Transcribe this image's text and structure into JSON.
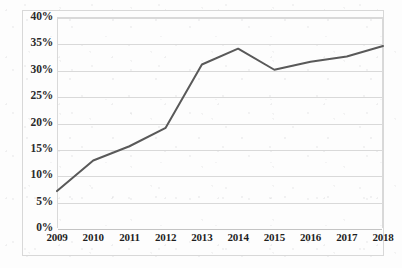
{
  "chart_data": {
    "type": "line",
    "title": "",
    "subtitle": "",
    "xlabel": "",
    "ylabel": "",
    "categories": [
      "2009",
      "2010",
      "2011",
      "2012",
      "2013",
      "2014",
      "2015",
      "2016",
      "2017",
      "2018"
    ],
    "values": [
      7,
      12.8,
      15.5,
      19,
      31,
      34,
      30,
      31.5,
      32.5,
      34.5
    ],
    "series": [
      {
        "name": "",
        "values": [
          7,
          12.8,
          15.5,
          19,
          31,
          34,
          30,
          31.5,
          32.5,
          34.5
        ],
        "color": "#595959"
      }
    ],
    "ylim": [
      0,
      40
    ],
    "ytick_values": [
      0,
      5,
      10,
      15,
      20,
      25,
      30,
      35,
      40
    ],
    "ytick_labels": [
      "0%",
      "5%",
      "10%",
      "15%",
      "20%",
      "25%",
      "30%",
      "35%",
      "40%"
    ],
    "grid": true,
    "grid_axis": "y",
    "legend": false,
    "legend_position": "none",
    "markers": false,
    "line_width": 2,
    "value_format": "percent",
    "annotations": []
  },
  "style": {
    "line_color": "#595959",
    "grid_color": "#d9d9d9",
    "axis_color": "#c4c4c4",
    "frame_color": "#d8d8d8",
    "label_color": "#1f1f1f",
    "background": "#fdfdfd"
  }
}
